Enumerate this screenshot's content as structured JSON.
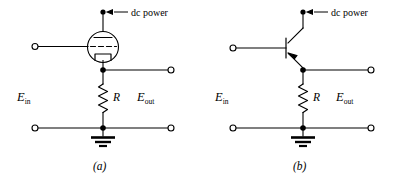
{
  "figure": {
    "caption_a": "(a)",
    "caption_b": "(b)",
    "panels": [
      {
        "id": "a",
        "caption": "(a)",
        "device": "vacuum-tube-triode",
        "device_name": "triode",
        "labels": {
          "dc_power": "dc power",
          "e_in_main": "E",
          "e_in_sub": "in",
          "e_out_main": "E",
          "e_out_sub": "out",
          "resistor": "R"
        }
      },
      {
        "id": "b",
        "caption": "(b)",
        "device": "bipolar-junction-transistor",
        "device_name": "transistor",
        "labels": {
          "dc_power": "dc power",
          "e_in_main": "E",
          "e_in_sub": "in",
          "e_out_main": "E",
          "e_out_sub": "out",
          "resistor": "R"
        }
      }
    ],
    "colors": {
      "ink": "#000000",
      "paper": "#ffffff"
    }
  }
}
